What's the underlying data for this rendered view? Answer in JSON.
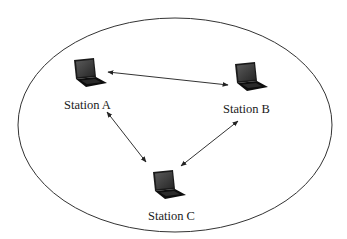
{
  "diagram": {
    "title": "",
    "boundary": {
      "shape": "ellipse",
      "cx": 175,
      "cy": 125,
      "rx": 157,
      "ry": 107,
      "stroke": "#333333"
    },
    "stations": [
      {
        "id": "A",
        "label": "Station A",
        "icon": "laptop-icon",
        "x": 72,
        "y": 58,
        "label_x": 64,
        "label_y": 98
      },
      {
        "id": "B",
        "label": "Station B",
        "icon": "laptop-icon",
        "x": 233,
        "y": 62,
        "label_x": 223,
        "label_y": 102
      },
      {
        "id": "C",
        "label": "Station C",
        "icon": "laptop-icon",
        "x": 151,
        "y": 170,
        "label_x": 148,
        "label_y": 209
      }
    ],
    "links": [
      {
        "from": "A",
        "to": "B",
        "x1": 108,
        "y1": 72,
        "x2": 228,
        "y2": 85,
        "type": "bidirectional"
      },
      {
        "from": "A",
        "to": "C",
        "x1": 107,
        "y1": 112,
        "x2": 146,
        "y2": 162,
        "type": "bidirectional"
      },
      {
        "from": "B",
        "to": "C",
        "x1": 238,
        "y1": 121,
        "x2": 181,
        "y2": 166,
        "type": "bidirectional"
      }
    ],
    "colors": {
      "line": "#333333",
      "laptop_screen": "#3a3a3a",
      "laptop_body": "#111111"
    }
  }
}
